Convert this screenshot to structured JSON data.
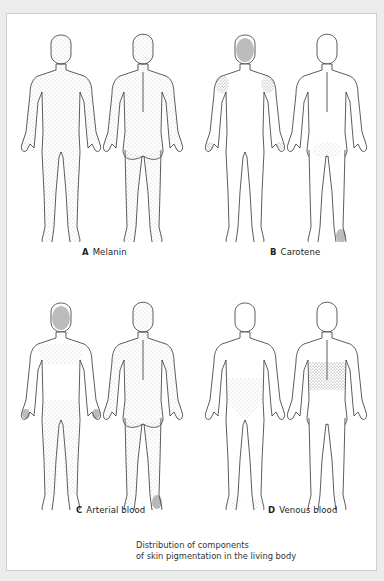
{
  "figure": {
    "caption_line1": "Distribution of components",
    "caption_line2": "of skin pigmentation in the living body",
    "panels": [
      {
        "letter": "A",
        "title": "Melanin",
        "shading": "diffuse-whole-body",
        "views": [
          "front",
          "back"
        ]
      },
      {
        "letter": "B",
        "title": "Carotene",
        "shading": "face-shoulders-palms-soles",
        "views": [
          "front",
          "back"
        ]
      },
      {
        "letter": "C",
        "title": "Arterial blood",
        "shading": "face-upper-body-palms-soles",
        "views": [
          "front",
          "back"
        ]
      },
      {
        "letter": "D",
        "title": "Venous blood",
        "shading": "lower-back-groin-feet",
        "views": [
          "front",
          "back"
        ]
      }
    ],
    "colors": {
      "background": "#ececec",
      "frame": "#ffffff",
      "outline": "#333333",
      "stipple": "#9a9a9a",
      "dark_stipple": "#555555"
    }
  }
}
